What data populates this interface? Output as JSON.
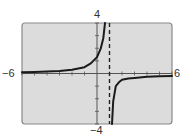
{
  "chart_data": {
    "type": "line",
    "title": "",
    "xlabel": "",
    "ylabel": "",
    "xlim": [
      -6,
      6
    ],
    "ylim": [
      -4,
      4
    ],
    "x_tick_step": 1,
    "y_tick_step": 1,
    "grid": false,
    "legend": null,
    "window_labels": {
      "xmin": "−6",
      "xmax": "6",
      "ymin": "−4",
      "ymax": "4"
    },
    "vertical_asymptote": {
      "x": 1,
      "style": "dashed"
    },
    "series": [
      {
        "name": "left branch",
        "x": [
          -6,
          -5,
          -4,
          -3,
          -2,
          -1,
          -0.5,
          0,
          0.3,
          0.5,
          0.64
        ],
        "y": [
          0.1,
          0.13,
          0.16,
          0.2,
          0.3,
          0.5,
          0.8,
          1.3,
          2.0,
          2.8,
          4.0
        ]
      },
      {
        "name": "right branch",
        "x": [
          1.2,
          1.3,
          1.5,
          1.8,
          2.0,
          2.5,
          3,
          4,
          5,
          6
        ],
        "y": [
          -4.0,
          -2.2,
          -1.0,
          -0.65,
          -0.5,
          -0.4,
          -0.35,
          -0.25,
          -0.22,
          -0.2
        ]
      }
    ]
  },
  "colors": {
    "frame_bg": "#dcdcdc",
    "frame_border": "#8a8a8a",
    "curve": "#1a1a1a",
    "axis": "#555555"
  }
}
